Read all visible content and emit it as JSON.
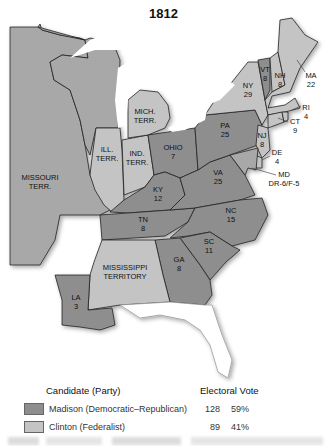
{
  "title": "1812",
  "colors": {
    "madison": "#8e8e8e",
    "clinton": "#c4c4c4",
    "territory": "#a8a8a8",
    "water": "#ffffff",
    "border": "#222222"
  },
  "regions": {
    "missouri": {
      "name": "MISSOURI",
      "line2": "TERR."
    },
    "ill": {
      "name": "ILL.",
      "line2": "TERR."
    },
    "ind": {
      "name": "IND.",
      "line2": "TERR."
    },
    "mich": {
      "name": "MICH.",
      "line2": "TERR."
    },
    "mississippi": {
      "name": "MISSISSIPPI",
      "line2": "TERRITORY"
    },
    "ohio": {
      "name": "OHIO",
      "votes": "7"
    },
    "ky": {
      "name": "KY",
      "votes": "12"
    },
    "tn": {
      "name": "TN",
      "votes": "8"
    },
    "ga": {
      "name": "GA",
      "votes": "8"
    },
    "sc": {
      "name": "SC",
      "votes": "11"
    },
    "nc": {
      "name": "NC",
      "votes": "15"
    },
    "va": {
      "name": "VA",
      "votes": "25"
    },
    "pa": {
      "name": "PA",
      "votes": "25"
    },
    "ny": {
      "name": "NY",
      "votes": "29"
    },
    "vt": {
      "name": "VT",
      "votes": "8"
    },
    "nh": {
      "name": "NH",
      "votes": "8"
    },
    "ma": {
      "name": "MA",
      "votes": "22"
    },
    "ri": {
      "name": "RI",
      "votes": "4"
    },
    "ct": {
      "name": "CT",
      "votes": "9"
    },
    "nj": {
      "name": "NJ",
      "votes": "8"
    },
    "de": {
      "name": "DE",
      "votes": "4"
    },
    "md": {
      "name": "MD",
      "votes": "DR-6/F-5"
    },
    "la": {
      "name": "LA",
      "votes": "3"
    }
  },
  "legend": {
    "candidate_header": "Candidate (Party)",
    "vote_header": "Electoral Vote",
    "rows": [
      {
        "name": "Madison (Democratic–Republican)",
        "votes": "128",
        "pct": "59%"
      },
      {
        "name": "Clinton (Federalist)",
        "votes": "89",
        "pct": "41%"
      }
    ]
  }
}
